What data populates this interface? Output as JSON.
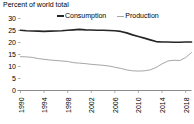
{
  "chart_data": {
    "type": "line",
    "title": "Percent of world total",
    "xlabel": "",
    "ylabel": "",
    "ylim": [
      0,
      30
    ],
    "yticks": [
      0,
      5,
      10,
      15,
      20,
      25,
      30
    ],
    "xlim": [
      1990,
      2019
    ],
    "xticks": [
      1990,
      1994,
      1998,
      2002,
      2006,
      2010,
      2014,
      2018
    ],
    "xtick_rotation": -90,
    "grid": false,
    "legend_position": "top",
    "x": [
      1990,
      1991,
      1992,
      1993,
      1994,
      1995,
      1996,
      1997,
      1998,
      1999,
      2000,
      2001,
      2002,
      2003,
      2004,
      2005,
      2006,
      2007,
      2008,
      2009,
      2010,
      2011,
      2012,
      2013,
      2014,
      2015,
      2016,
      2017,
      2018,
      2019
    ],
    "series": [
      {
        "name": "Consumption",
        "color": "#262626",
        "values": [
          25.1,
          24.9,
          24.8,
          24.7,
          24.6,
          24.7,
          24.8,
          24.9,
          25.1,
          25.3,
          25.5,
          25.3,
          25.2,
          25.1,
          25.1,
          25.0,
          24.9,
          24.6,
          24.0,
          23.2,
          22.5,
          21.8,
          21.1,
          20.4,
          20.2,
          20.2,
          20.1,
          20.1,
          20.2,
          20.2
        ]
      },
      {
        "name": "Production",
        "color": "#a6a6a6",
        "values": [
          14.1,
          14.0,
          13.8,
          13.3,
          13.0,
          12.7,
          12.5,
          12.3,
          12.1,
          11.6,
          11.4,
          11.2,
          10.9,
          10.7,
          10.5,
          10.2,
          9.7,
          9.2,
          8.6,
          8.2,
          8.1,
          8.2,
          8.6,
          9.6,
          11.1,
          12.3,
          12.6,
          12.5,
          13.7,
          15.8
        ]
      }
    ]
  }
}
